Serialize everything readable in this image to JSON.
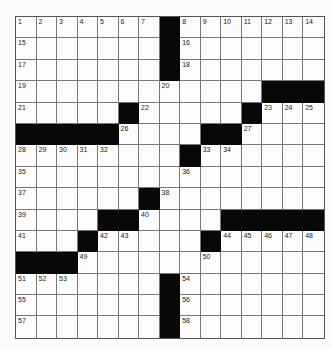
{
  "puzzle": {
    "rows": 15,
    "cols": 15,
    "colors": {
      "black": "#080808",
      "white": "#fcfcfc",
      "line": "#777777"
    },
    "grid": [
      [
        "1",
        "2",
        "3",
        "4",
        "5",
        "6",
        "7",
        "#",
        "8",
        "9",
        "10",
        "11",
        "12",
        "13",
        "14"
      ],
      [
        "15",
        "",
        "",
        "",
        "",
        "",
        "",
        "#",
        "16",
        "",
        "",
        "",
        "",
        "",
        ""
      ],
      [
        "17",
        "",
        "",
        "",
        "",
        "",
        "",
        "#",
        "18",
        "",
        "",
        "",
        "",
        "",
        ""
      ],
      [
        "19",
        "",
        "",
        "",
        "",
        "",
        "",
        "20",
        "",
        "",
        "",
        "",
        "#",
        "#",
        "#"
      ],
      [
        "21",
        "",
        "",
        "",
        "",
        "#",
        "22",
        "",
        "",
        "",
        "",
        "#",
        "23",
        "24",
        "25"
      ],
      [
        "#",
        "#",
        "#",
        "#",
        "#",
        "26",
        "",
        "",
        "",
        "#",
        "#",
        "27",
        "",
        "",
        ""
      ],
      [
        "28",
        "29",
        "30",
        "31",
        "32",
        "",
        "",
        "",
        "#",
        "33",
        "34",
        "",
        "",
        "",
        ""
      ],
      [
        "35",
        "",
        "",
        "",
        "",
        "",
        "",
        "",
        "36",
        "",
        "",
        "",
        "",
        "",
        ""
      ],
      [
        "37",
        "",
        "",
        "",
        "",
        "",
        "#",
        "38",
        "",
        "",
        "",
        "",
        "",
        "",
        ""
      ],
      [
        "39",
        "",
        "",
        "",
        "#",
        "#",
        "40",
        "",
        "",
        "",
        "#",
        "#",
        "#",
        "#",
        "#"
      ],
      [
        "41",
        "",
        "",
        "#",
        "42",
        "43",
        "",
        "",
        "",
        "#",
        "44",
        "45",
        "46",
        "47",
        "48"
      ],
      [
        "#",
        "#",
        "#",
        "49",
        "",
        "",
        "",
        "",
        "",
        "50",
        "",
        "",
        "",
        "",
        ""
      ],
      [
        "51",
        "52",
        "53",
        "",
        "",
        "",
        "",
        "#",
        "54",
        "",
        "",
        "",
        "",
        "",
        ""
      ],
      [
        "55",
        "",
        "",
        "",
        "",
        "",
        "",
        "#",
        "56",
        "",
        "",
        "",
        "",
        "",
        ""
      ],
      [
        "57",
        "",
        "",
        "",
        "",
        "",
        "",
        "#",
        "58",
        "",
        "",
        "",
        "",
        "",
        ""
      ]
    ]
  }
}
